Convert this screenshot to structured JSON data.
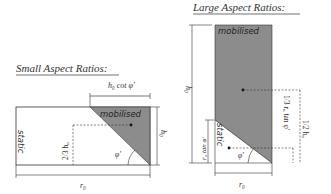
{
  "small_panel": {
    "title": "Small Aspect Ratios:",
    "top_dimension_label": "h₀ cot φ'",
    "mobilised_label": "mobilised",
    "static_label": "static",
    "centroid_height_label": "2/3 h₀",
    "height_label": "h₀",
    "width_label": "r₀",
    "angle_label": "φ'"
  },
  "large_panel": {
    "title": "Large Aspect Ratios:",
    "mobilised_label": "mobilised",
    "static_label": "static",
    "height_label": "h₀",
    "wedge_height_label": "r₀ tan φ'",
    "mobilised_centroid_label": "1/2 h₀",
    "static_centroid_label": "1/3 r₀ tan φ'",
    "width_label": "r₀",
    "angle_label": "φ'"
  },
  "colors": {
    "mobilised_fill": "#8c8c8c",
    "line": "#333333",
    "text": "#333333",
    "background": "#ffffff"
  }
}
